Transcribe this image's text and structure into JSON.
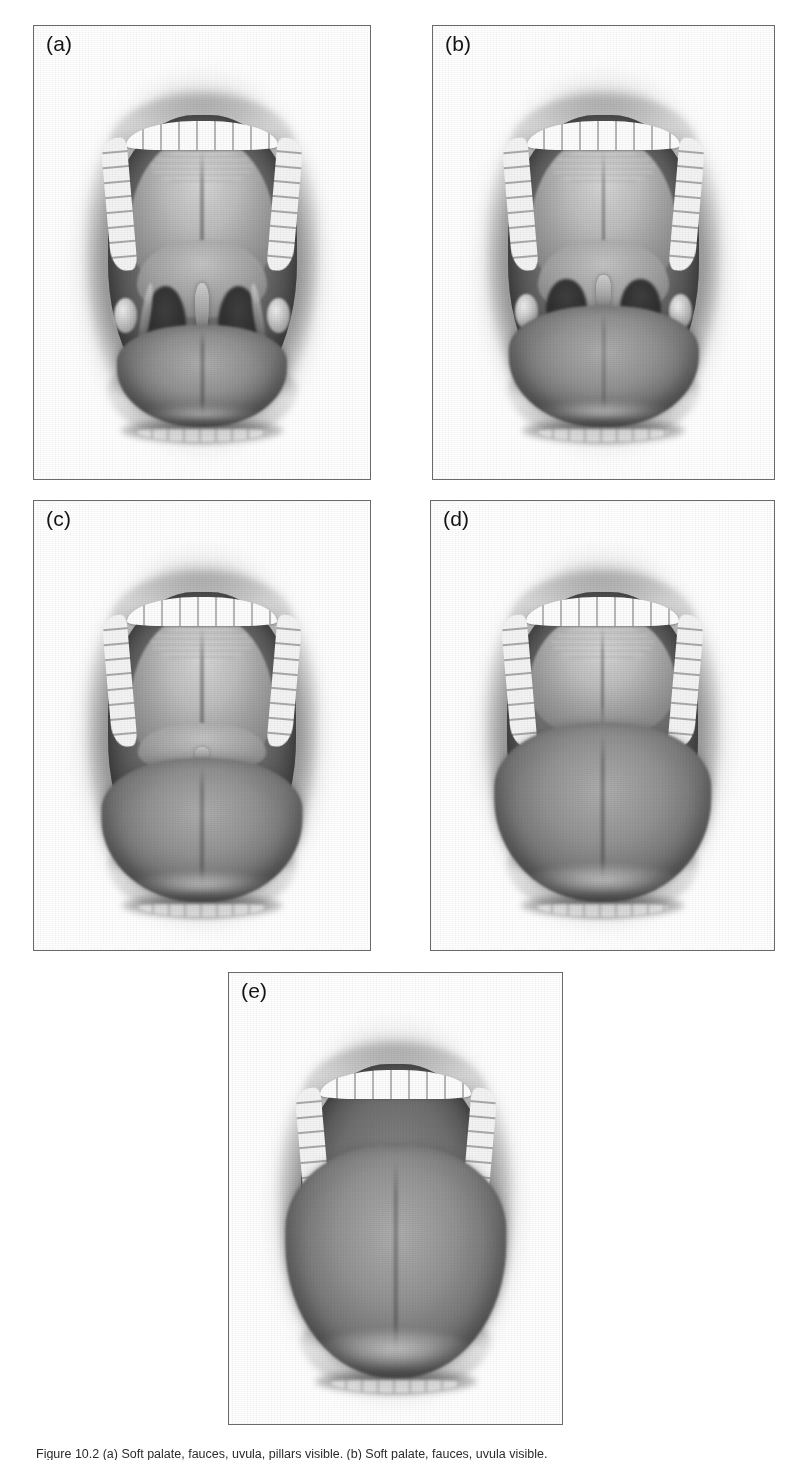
{
  "figure": {
    "domain": "medical-illustration",
    "background_color": "#ffffff",
    "ink_color": "#1a1a1a",
    "frame_color": "#6a6a6a",
    "panel_count": 5,
    "caption_visible_fragment": "Figure 10.2 (a) Soft palate, fauces, uvula, pillars visible. (b) Soft palate, fauces, uvula visible."
  },
  "panels": [
    {
      "id": "a",
      "label": "(a)",
      "row": 1,
      "column": 1,
      "description": "Soft palate, fauces, uvula and tonsillar pillars all visible",
      "visible_structures": [
        "hard palate",
        "soft palate",
        "uvula",
        "fauces",
        "anterior pillars",
        "posterior pillars",
        "tonsils",
        "tongue",
        "upper teeth",
        "lower teeth"
      ],
      "tongue_height": "low",
      "uvula_visible": "full"
    },
    {
      "id": "b",
      "label": "(b)",
      "row": 1,
      "column": 2,
      "description": "Soft palate, fauces and uvula visible; pillars masked by the tongue base",
      "visible_structures": [
        "hard palate",
        "soft palate",
        "uvula",
        "fauces",
        "tonsils",
        "tongue",
        "upper teeth"
      ],
      "tongue_height": "medium-low",
      "uvula_visible": "partial"
    },
    {
      "id": "c",
      "label": "(c)",
      "row": 2,
      "column": 1,
      "description": "Soft palate and base of uvula visible only",
      "visible_structures": [
        "hard palate",
        "soft palate",
        "base of uvula",
        "tongue",
        "upper teeth"
      ],
      "tongue_height": "medium-high",
      "uvula_visible": "base only"
    },
    {
      "id": "d",
      "label": "(d)",
      "row": 2,
      "column": 2,
      "description": "Only hard palate visible; soft palate and uvula obscured by tongue",
      "visible_structures": [
        "hard palate",
        "tongue",
        "upper teeth"
      ],
      "tongue_height": "high",
      "uvula_visible": "none"
    },
    {
      "id": "e",
      "label": "(e)",
      "row": 3,
      "column": 1,
      "description": "Tongue fills the oral cavity; palate not visible",
      "visible_structures": [
        "tongue",
        "upper teeth"
      ],
      "tongue_height": "very high",
      "uvula_visible": "none"
    }
  ],
  "caption": {
    "text": "Figure 10.2 (a) Soft palate, fauces, uvula, pillars visible. (b) Soft palate, fauces, uvula visible.",
    "clipped": true
  }
}
